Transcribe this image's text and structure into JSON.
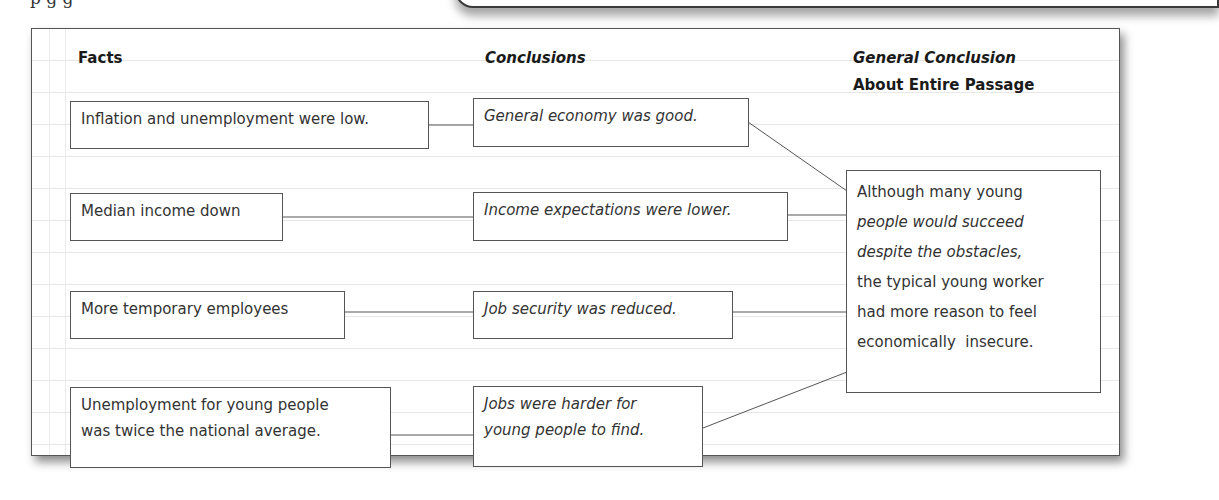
{
  "top_fragment": "p  g    g",
  "diagram": {
    "headers": {
      "facts": "Facts",
      "conclusions": "Conclusions",
      "general_line1": "General Conclusion",
      "general_line2": "About Entire Passage"
    },
    "facts": [
      {
        "line1": "Inflation and unemployment were low."
      },
      {
        "line1": "Median income down"
      },
      {
        "line1": "More temporary employees"
      },
      {
        "line1": "Unemployment for young people",
        "line2": "was twice the national average."
      }
    ],
    "conclusions": [
      {
        "line1": "General economy was good."
      },
      {
        "line1": "Income expectations were lower."
      },
      {
        "line1": "Job security was reduced."
      },
      {
        "line1": "Jobs were harder for",
        "line2": "young people to find."
      }
    ],
    "general_conclusion": {
      "lines": [
        "Although many young",
        "people would succeed",
        "despite the obstacles,",
        "the typical young worker",
        "had more reason to feel",
        "economically  insecure."
      ]
    },
    "colors": {
      "border": "#555555",
      "text": "#333333",
      "heading": "#1a1a1a",
      "rule_lines": "#e7e7e7"
    }
  }
}
